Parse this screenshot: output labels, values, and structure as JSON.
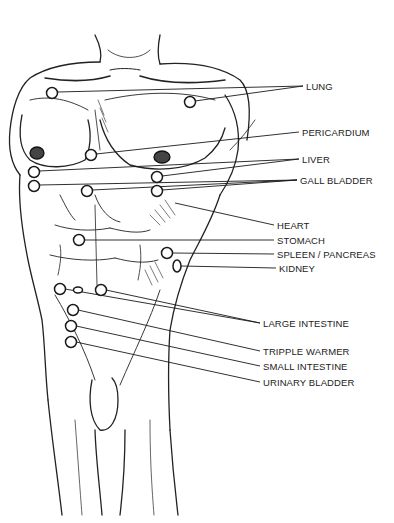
{
  "diagram": {
    "line_color": "#1a1a1a",
    "labels": [
      {
        "id": "lung",
        "text": "LUNG",
        "x": 306,
        "y": 81
      },
      {
        "id": "pericardium",
        "text": "PERICARDIUM",
        "x": 302,
        "y": 127
      },
      {
        "id": "liver",
        "text": "LIVER",
        "x": 302,
        "y": 154
      },
      {
        "id": "gall-bladder",
        "text": "GALL BLADDER",
        "x": 300,
        "y": 175
      },
      {
        "id": "heart",
        "text": "HEART",
        "x": 277,
        "y": 220
      },
      {
        "id": "stomach",
        "text": "STOMACH",
        "x": 277,
        "y": 235
      },
      {
        "id": "spleen-pancreas",
        "text": "SPLEEN / PANCREAS",
        "x": 277,
        "y": 249
      },
      {
        "id": "kidney",
        "text": "KIDNEY",
        "x": 279,
        "y": 263
      },
      {
        "id": "large-intestine",
        "text": "LARGE INTESTINE",
        "x": 263,
        "y": 318
      },
      {
        "id": "tripple-warmer",
        "text": "TRIPPLE WARMER",
        "x": 263,
        "y": 346
      },
      {
        "id": "small-intestine",
        "text": "SMALL INTESTINE",
        "x": 263,
        "y": 361
      },
      {
        "id": "urinary-bladder",
        "text": "URINARY BLADDER",
        "x": 263,
        "y": 377
      }
    ]
  }
}
